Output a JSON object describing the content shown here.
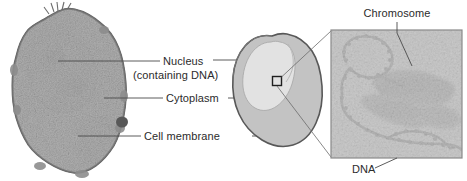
{
  "figure": {
    "background_color": "#ffffff",
    "label_color": "#2b2b2b",
    "leader_line_color": "#4a4a4a"
  },
  "labels": {
    "nucleus": "Nucleus",
    "nucleus_sub": "(containing DNA)",
    "cytoplasm": "Cytoplasm",
    "cell_membrane": "Cell membrane",
    "chromosome": "Chromosome",
    "dna": "DNA"
  },
  "panels": {
    "micrograph": {
      "name": "cell-electron-micrograph",
      "description": "Grayscale transmission electron micrograph of a whole cell with large nucleus"
    },
    "schematic": {
      "name": "cell-schematic",
      "description": "Simplified gray blob cell showing nucleus, cytoplasm and membrane",
      "outline_color": "#585858",
      "cytoplasm_color": "#c3c3c3",
      "nucleus_color": "#e2e2e2"
    },
    "magnified": {
      "name": "chromosome-dna-micrograph",
      "description": "Magnified electron micrograph of a chromosome with DNA loops",
      "border_color": "#8a8a8a",
      "background_color": "#dcdcdc"
    }
  }
}
